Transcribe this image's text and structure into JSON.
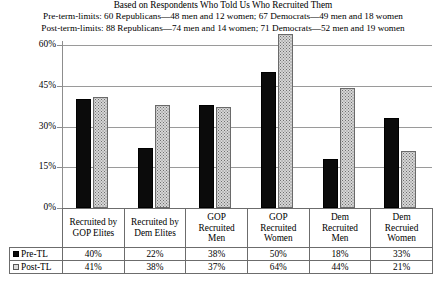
{
  "header": {
    "line1": "Based on Respondents Who Told Us Who Recruited Them",
    "line2": "Pre-term-limits: 60 Republicans—48 men and 12 women; 67 Democrats—49 men and 18 women",
    "line3": "Post-term-limits: 88 Republicans—74 men and 14 women;  71 Democrats—52 men and 19 women"
  },
  "legend": {
    "pre_label": "Pre-TL",
    "post_label": "Post-TL",
    "pre_swatch": "black-square-icon",
    "post_swatch": "stippled-square-icon"
  },
  "chart_data": {
    "type": "bar",
    "title": "Based on Respondents Who Told Us Who Recruited Them",
    "xlabel": "",
    "ylabel": "",
    "ylim": [
      0,
      60
    ],
    "yticks": [
      0,
      15,
      30,
      45,
      60
    ],
    "ytick_labels": [
      "0%",
      "15%",
      "30%",
      "45%",
      "60%"
    ],
    "grid": true,
    "legend_position": "table-row-headers",
    "categories": [
      "Recruited by GOP Elites",
      "Recruited by Dem Elites",
      "GOP Recruited Men",
      "GOP Recruited Women",
      "Dem Recruited Men",
      "Dem Recruied Women"
    ],
    "category_lines": [
      [
        "Recruited by",
        "GOP Elites"
      ],
      [
        "Recruited by",
        "Dem Elites"
      ],
      [
        "GOP",
        "Recruited",
        "Men"
      ],
      [
        "GOP",
        "Recruited",
        "Women"
      ],
      [
        "Dem",
        "Recruited",
        "Men"
      ],
      [
        "Dem",
        "Recruied",
        "Women"
      ]
    ],
    "series": [
      {
        "name": "Pre-TL",
        "color": "#0b0b0b",
        "values": [
          40,
          22,
          38,
          50,
          18,
          33
        ],
        "labels": [
          "40%",
          "22%",
          "38%",
          "50%",
          "18%",
          "33%"
        ]
      },
      {
        "name": "Post-TL",
        "color": "#d6d6d6",
        "values": [
          41,
          38,
          37,
          64,
          44,
          21
        ],
        "labels": [
          "41%",
          "38%",
          "37%",
          "64%",
          "44%",
          "21%"
        ]
      }
    ]
  }
}
